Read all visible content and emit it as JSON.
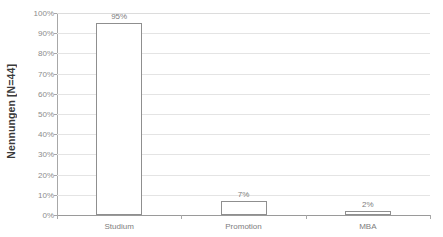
{
  "chart_data": {
    "type": "bar",
    "title": "",
    "xlabel": "",
    "ylabel": "Nennungen [N=44]",
    "categories": [
      "Studium",
      "Promotion",
      "MBA"
    ],
    "values": [
      95,
      7,
      2
    ],
    "value_labels": [
      "95%",
      "7%",
      "2%"
    ],
    "ylim": [
      0,
      100
    ],
    "ytick_values": [
      0,
      10,
      20,
      30,
      40,
      50,
      60,
      70,
      80,
      90,
      100
    ],
    "ytick_labels": [
      "0%",
      "10%",
      "20%",
      "30%",
      "40%",
      "50%",
      "60%",
      "70%",
      "80%",
      "90%",
      "100%"
    ],
    "grid": true,
    "legend": false,
    "legend_position": "none",
    "bar_fill_color": "#ffffff",
    "bar_border_color": "#8f8f8f",
    "gridline_color": "#e4e4e4",
    "axis_color": "#a8a8a8",
    "label_color": "#7d7d7d",
    "axis_title_color": "#3a3a3a"
  }
}
